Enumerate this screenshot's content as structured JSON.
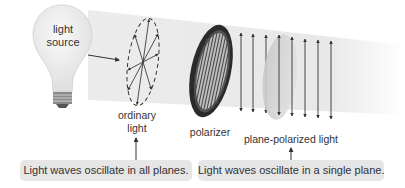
{
  "diagram": {
    "labels": {
      "light_source": [
        "light",
        "source"
      ],
      "ordinary_light": [
        "ordinary",
        "light"
      ],
      "polarizer": "polarizer",
      "plane_polarized_light": "plane-polarized light"
    },
    "captions": {
      "left": "Light waves oscillate in all planes.",
      "right": "Light waves oscillate in a single plane."
    },
    "colors": {
      "beam": "#e9e9e9",
      "caption_box": "#e6e6e6",
      "arrow": "#333333",
      "polarizer_ring": "#2b2b2b",
      "text": "#333333"
    }
  }
}
